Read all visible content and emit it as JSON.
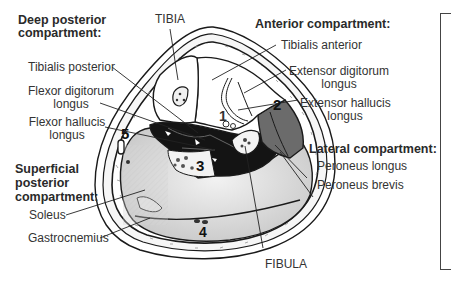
{
  "title_labels": {
    "tibia": "TIBIA",
    "fibula": "FIBULA"
  },
  "compartments": {
    "deep_posterior": {
      "heading_line1": "Deep posterior",
      "heading_line2": "compartment:",
      "muscles": [
        {
          "line1": "Tibialis posterior",
          "line2": ""
        },
        {
          "line1": "Flexor digitorum",
          "line2": "longus"
        },
        {
          "line1": "Flexor hallucis",
          "line2": "longus"
        }
      ]
    },
    "superficial_posterior": {
      "heading_line1": "Superficial",
      "heading_line2": "posterior",
      "heading_line3": "compartment:",
      "muscles": [
        "Soleus",
        "Gastrocnemius"
      ]
    },
    "anterior": {
      "heading": "Anterior compartment:",
      "muscles": [
        {
          "line1": "Tibialis anterior",
          "line2": ""
        },
        {
          "line1": "Extensor digitorum",
          "line2": "longus"
        },
        {
          "line1": "Extensor hallucis",
          "line2": "longus"
        }
      ]
    },
    "lateral": {
      "heading": "Lateral compartment:",
      "muscles": [
        "Peroneus longus",
        "Peroneus brevis"
      ]
    }
  },
  "region_numbers": [
    "1",
    "2",
    "3",
    "4",
    "5"
  ],
  "colors": {
    "outline": "#1a1a1a",
    "deep_posterior_fill": "#141414",
    "lateral_fill": "#6b6b6b",
    "superficial_fill": "#d8d8d8",
    "anterior_fill": "#ffffff",
    "skin_fill": "#f4f4f4"
  }
}
